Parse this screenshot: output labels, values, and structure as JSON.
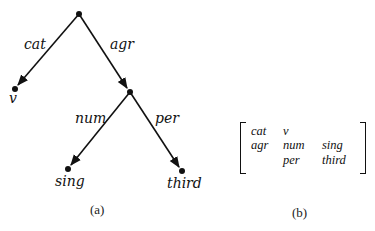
{
  "tree": {
    "nodes": [
      {
        "id": "root",
        "x": 79,
        "y": 14
      },
      {
        "id": "v",
        "x": 15,
        "y": 89,
        "label": "v"
      },
      {
        "id": "agr",
        "x": 130,
        "y": 92
      },
      {
        "id": "sing",
        "x": 68,
        "y": 169,
        "label": "sing"
      },
      {
        "id": "third",
        "x": 182,
        "y": 171,
        "label": "third"
      }
    ],
    "edges": [
      {
        "from": "root",
        "to": "v",
        "label": "cat"
      },
      {
        "from": "root",
        "to": "agr",
        "label": "agr"
      },
      {
        "from": "agr",
        "to": "sing",
        "label": "num"
      },
      {
        "from": "agr",
        "to": "third",
        "label": "per"
      }
    ],
    "caption": "(a)"
  },
  "matrix": {
    "rows": [
      [
        "cat",
        "v",
        ""
      ],
      [
        "agr",
        "num",
        "sing"
      ],
      [
        "",
        "per",
        "third"
      ]
    ],
    "caption": "(b)"
  },
  "colors": {
    "ink": "#111111",
    "background": "#ffffff"
  }
}
